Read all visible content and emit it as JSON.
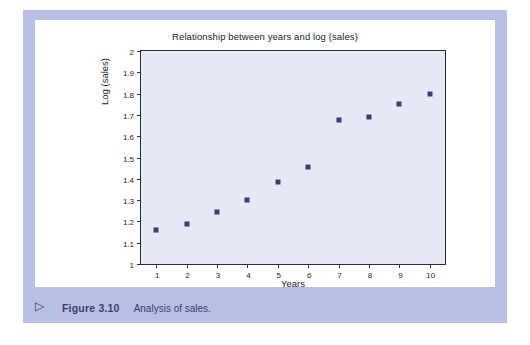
{
  "figure": {
    "caption_marker": "▷",
    "caption_number": "Figure 3.10",
    "caption_text": "Analysis of sales.",
    "frame_color": "#b9bee4",
    "card_color": "#ffffff",
    "caption_color": "#3b3d72"
  },
  "chart_data": {
    "type": "scatter",
    "title": "Relationship between years and log (sales)",
    "xlabel": "Years",
    "ylabel": "Log (sales)",
    "x": [
      1,
      2,
      3,
      4,
      5,
      6,
      7,
      8,
      9,
      10
    ],
    "values": [
      1.16,
      1.19,
      1.245,
      1.3,
      1.385,
      1.455,
      1.675,
      1.69,
      1.75,
      1.8
    ],
    "xlim": [
      0.5,
      10.5
    ],
    "ylim": [
      1,
      2
    ],
    "xticks": [
      1,
      2,
      3,
      4,
      5,
      6,
      7,
      8,
      9,
      10
    ],
    "xticklabels": [
      "1",
      "2",
      "3",
      "4",
      "5",
      "6",
      "7",
      "8",
      "9",
      "10"
    ],
    "yticks": [
      1,
      1.1,
      1.2,
      1.3,
      1.4,
      1.5,
      1.6,
      1.7,
      1.8,
      1.9,
      2
    ],
    "yticklabels": [
      "1",
      "1.1",
      "1.2",
      "1.3",
      "1.4",
      "1.5",
      "1.6",
      "1.7",
      "1.8",
      "1.9",
      "2"
    ],
    "grid": false,
    "legend": false,
    "marker": "square",
    "marker_color": "#3b3d72",
    "plot_bg": "#e5e8f5",
    "axis_color": "#2b2b3c"
  }
}
